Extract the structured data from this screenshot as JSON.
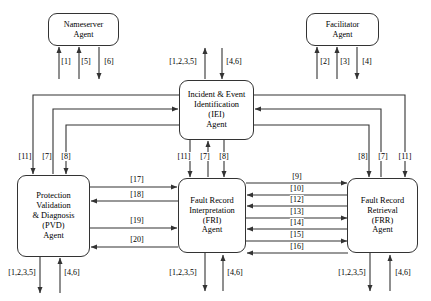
{
  "diagram": {
    "type": "block-diagram",
    "nodes": [
      {
        "id": "nameserver",
        "lines": [
          "Nameserver",
          "Agent"
        ]
      },
      {
        "id": "facilitator",
        "lines": [
          "Facilitator",
          "Agent"
        ]
      },
      {
        "id": "iei",
        "lines": [
          "Incident & Event",
          "Identification",
          "(IEI)",
          "Agent"
        ]
      },
      {
        "id": "pvd",
        "lines": [
          "Protection",
          "Validation",
          "& Diagnosis",
          "(PVD)",
          "Agent"
        ]
      },
      {
        "id": "fri",
        "lines": [
          "Fault Record",
          "Interpretation",
          "(FRI)",
          "Agent"
        ]
      },
      {
        "id": "frr",
        "lines": [
          "Fault Record",
          "Retrieval",
          "(FRR)",
          "Agent"
        ]
      }
    ],
    "edge_labels": {
      "ns_1": "[1]",
      "ns_5": "[5]",
      "ns_6": "[6]",
      "fac_2": "[2]",
      "fac_3": "[3]",
      "fac_4": "[4]",
      "iei_top_out": "[1,2,3,5]",
      "iei_top_in": "[4,6]",
      "pvd_left_11": "[11]",
      "pvd_left_7": "[7]",
      "pvd_left_8": "[8]",
      "fri_up_11": "[11]",
      "fri_up_7": "[7]",
      "fri_up_8": "[8]",
      "frr_right_8": "[8]",
      "frr_right_7": "[7]",
      "frr_right_11": "[11]",
      "pvd_fri_17": "[17]",
      "pvd_fri_18": "[18]",
      "pvd_fri_19": "[19]",
      "pvd_fri_20": "[20]",
      "fri_frr_9": "[9]",
      "fri_frr_10": "[10]",
      "fri_frr_12": "[12]",
      "fri_frr_13": "[13]",
      "fri_frr_14": "[14]",
      "fri_frr_15": "[15]",
      "fri_frr_16": "[16]",
      "pvd_bot_out": "[1,2,3,5]",
      "pvd_bot_in": "[4,6]",
      "fri_bot_out": "[1,2,3,5]",
      "fri_bot_in": "[4,6]",
      "frr_bot_out": "[1,2,3,5]",
      "frr_bot_in": "[4,6]"
    },
    "colors": {
      "stroke": "#333333",
      "text": "#000000",
      "background": "#ffffff"
    }
  }
}
